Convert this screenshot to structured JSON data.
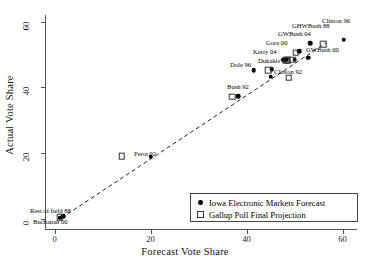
{
  "chart_data": {
    "type": "scatter",
    "title": "",
    "xlabel": "Forecast Vote Share",
    "ylabel": "Actual Vote Share",
    "xlim": [
      -2,
      63
    ],
    "ylim": [
      -3,
      62
    ],
    "xticks": [
      0,
      20,
      40,
      60
    ],
    "yticks": [
      0,
      20,
      40,
      60
    ],
    "grid": false,
    "legend_position": "bottom-right",
    "reference_line": {
      "style": "dashed",
      "from": [
        1.5,
        0.4
      ],
      "to": [
        56.5,
        53.5
      ]
    },
    "series": [
      {
        "name": "Iowa Electronic Markets Forecast",
        "marker": "filled-circle",
        "points": [
          {
            "label": "Rest of field 88",
            "x": 1.8,
            "y": 0.9
          },
          {
            "label": "Buchanan 00",
            "x": 1.2,
            "y": 0.4
          },
          {
            "label": "Perot 92",
            "x": 20.0,
            "y": 19.0
          },
          {
            "label": "Bush 92",
            "x": 38.2,
            "y": 37.4
          },
          {
            "label": "Dole 96",
            "x": 41.5,
            "y": 45.2
          },
          {
            "label": "Clinton 92",
            "x": 45.0,
            "y": 43.2
          },
          {
            "label": "Dukakis 88",
            "x": 45.2,
            "y": 45.6
          },
          {
            "label": "Kerry 04",
            "x": 47.6,
            "y": 48.4
          },
          {
            "label": "Gore 00",
            "x": 48.3,
            "y": 48.6
          },
          {
            "label": "GWBush 00",
            "x": 50.0,
            "y": 48.4
          },
          {
            "label": "GWBush 04",
            "x": 51.0,
            "y": 51.0
          },
          {
            "label": "GHWBush 88",
            "x": 52.8,
            "y": 49.0
          },
          {
            "label": "GHWBush 88b",
            "x": 53.2,
            "y": 53.4
          },
          {
            "label": "Clinton 96",
            "x": 60.2,
            "y": 54.5
          }
        ]
      },
      {
        "name": "Gallup Poll Final Projection",
        "marker": "open-square",
        "points": [
          {
            "label": "Rest of field 88",
            "x": 1.1,
            "y": 0.6
          },
          {
            "label": "Perot 92",
            "x": 14.0,
            "y": 19.2
          },
          {
            "label": "Bush 92",
            "x": 37.0,
            "y": 37.2
          },
          {
            "label": "Dukakis 88",
            "x": 44.5,
            "y": 45.3
          },
          {
            "label": "Clinton 92",
            "x": 48.8,
            "y": 43.0
          },
          {
            "label": "Kerry 04",
            "x": 48.2,
            "y": 48.2
          },
          {
            "label": "Gore 00",
            "x": 48.6,
            "y": 48.2
          },
          {
            "label": "GWBush 00",
            "x": 49.5,
            "y": 48.4
          },
          {
            "label": "GWBush 04",
            "x": 50.2,
            "y": 50.6
          },
          {
            "label": "GHWBush 88",
            "x": 56.0,
            "y": 53.2
          }
        ]
      }
    ],
    "annotations": [
      {
        "text": "Rest of field 88",
        "x": 30,
        "y": 208,
        "anchor": "left"
      },
      {
        "text": "Buchanan 00",
        "x": 33,
        "y": 219,
        "anchor": "left"
      },
      {
        "text": "Perot 92",
        "x": 134,
        "y": 151,
        "anchor": "left"
      },
      {
        "text": "Bush 92",
        "x": 227,
        "y": 84,
        "anchor": "left"
      },
      {
        "text": "Dole 96",
        "x": 230,
        "y": 62,
        "anchor": "left"
      },
      {
        "text": "Dukakis 88",
        "x": 258,
        "y": 58,
        "anchor": "left"
      },
      {
        "text": "Clinton 92",
        "x": 274,
        "y": 69,
        "anchor": "left"
      },
      {
        "text": "Kerry 04",
        "x": 253,
        "y": 49,
        "anchor": "left"
      },
      {
        "text": "Gore 00",
        "x": 266,
        "y": 40,
        "anchor": "left"
      },
      {
        "text": "GWBush 00",
        "x": 306,
        "y": 47,
        "anchor": "left"
      },
      {
        "text": "GWBush 04",
        "x": 278,
        "y": 31,
        "anchor": "left"
      },
      {
        "text": "GHWBush 88",
        "x": 292,
        "y": 23,
        "anchor": "left"
      },
      {
        "text": "Clinton 96",
        "x": 322,
        "y": 18,
        "anchor": "left"
      }
    ]
  },
  "axes": {
    "x": {
      "title": "Forecast Vote Share",
      "tick_labels": [
        "0",
        "20",
        "40",
        "60"
      ]
    },
    "y": {
      "title": "Actual Vote Share",
      "tick_labels": [
        "0",
        "20",
        "40",
        "60"
      ]
    }
  },
  "legend": {
    "entries": [
      {
        "label": "Iowa Electronic Markets Forecast",
        "marker": "filled-circle"
      },
      {
        "label": "Gallup Poll Final Projection",
        "marker": "open-square"
      }
    ]
  },
  "colors": {
    "marker": "#000000",
    "axis": "#555555",
    "text": "#111111",
    "background": "#ffffff"
  }
}
